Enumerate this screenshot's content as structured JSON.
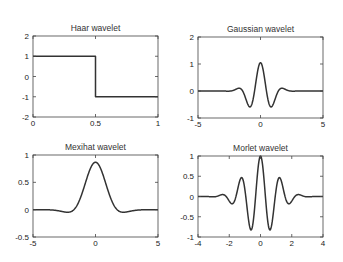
{
  "chart_data": [
    {
      "type": "line",
      "title": "Haar wavelet",
      "xlabel": "",
      "ylabel": "",
      "xlim": [
        0,
        1
      ],
      "ylim": [
        -2,
        2
      ],
      "xticks": [
        "0",
        "0.5",
        "1"
      ],
      "yticks": [
        "2",
        "1",
        "0",
        "-1",
        "-2"
      ],
      "grid": false,
      "x": [
        0,
        0.5,
        0.5,
        1
      ],
      "y": [
        1,
        1,
        -1,
        -1
      ],
      "box": {
        "left": 33,
        "right": 158,
        "top": 36,
        "bottom": 117
      }
    },
    {
      "type": "line",
      "title": "Gaussian wavelet",
      "xlabel": "",
      "ylabel": "",
      "xlim": [
        -5,
        5
      ],
      "ylim": [
        -1,
        2
      ],
      "xticks": [
        "-5",
        "0",
        "5"
      ],
      "yticks": [
        "2",
        "1",
        "0",
        "-1"
      ],
      "grid": false,
      "x": [
        -5,
        -2.5,
        -2,
        -1.5,
        -1,
        -0.6,
        0,
        0.6,
        1,
        1.5,
        2,
        2.5,
        5
      ],
      "y": [
        0,
        -0.05,
        0.1,
        0.35,
        -0.2,
        -0.8,
        1.05,
        -0.8,
        -0.2,
        0.35,
        0.1,
        -0.05,
        0
      ],
      "box": {
        "left": 198,
        "right": 323,
        "top": 37,
        "bottom": 118
      }
    },
    {
      "type": "line",
      "title": "Mexihat wavelet",
      "xlabel": "",
      "ylabel": "",
      "xlim": [
        -5,
        5
      ],
      "ylim": [
        -0.5,
        1
      ],
      "xticks": [
        "-5",
        "0",
        "5"
      ],
      "yticks": [
        "1",
        "0.5",
        "0",
        "-0.5"
      ],
      "grid": false,
      "x": [
        -5,
        -3,
        -1.73,
        -1,
        0,
        1,
        1.73,
        3,
        5
      ],
      "y": [
        0,
        -0.05,
        -0.4,
        0,
        0.87,
        0,
        -0.4,
        -0.05,
        0
      ],
      "box": {
        "left": 33,
        "right": 158,
        "top": 155,
        "bottom": 237
      }
    },
    {
      "type": "line",
      "title": "Morlet wavelet",
      "xlabel": "",
      "ylabel": "",
      "xlim": [
        -4,
        4
      ],
      "ylim": [
        -1,
        1
      ],
      "xticks": [
        "-4",
        "-2",
        "0",
        "2",
        "4"
      ],
      "yticks": [
        "1",
        "0.5",
        "0",
        "-0.5",
        "-1"
      ],
      "grid": false,
      "x": [
        -4,
        -2.5,
        -1.8,
        -1.2,
        -0.6,
        0,
        0.6,
        1.2,
        1.8,
        2.5,
        4
      ],
      "y": [
        0,
        0.05,
        -0.2,
        0.45,
        -0.85,
        1,
        -0.85,
        0.45,
        -0.2,
        0.05,
        0
      ],
      "box": {
        "left": 198,
        "right": 323,
        "top": 156,
        "bottom": 237
      }
    }
  ]
}
